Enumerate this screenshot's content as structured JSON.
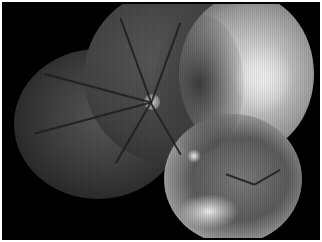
{
  "image": {
    "subject": "retinal fundus montage",
    "color_mode": "grayscale",
    "components": [
      "left-fundus-field",
      "top-fundus-field",
      "right-fundus-field",
      "bottom-fundus-field",
      "optic-disc"
    ],
    "colors": {
      "background": "#000000",
      "border": "#ffffff",
      "bright_region": "#e8e8e8",
      "dark_region": "#2a2a2a"
    }
  }
}
